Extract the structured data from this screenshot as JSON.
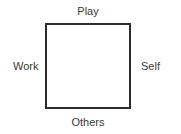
{
  "diagram": {
    "type": "square-four-edge-labels",
    "background_color": "#ffffff",
    "shape": {
      "name": "square",
      "border_color": "#2c2c2c",
      "border_width_px": 2,
      "fill_color": "#ffffff",
      "x": 45,
      "y": 23,
      "width": 86,
      "height": 86
    },
    "label_color": "#3a3a3a",
    "labels": {
      "top": "Play",
      "left": "Work",
      "right": "Self",
      "bottom": "Others"
    }
  }
}
